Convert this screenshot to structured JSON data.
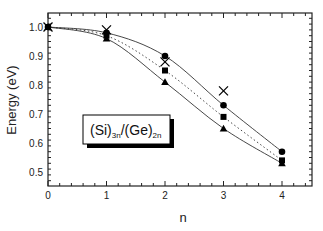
{
  "chart_data": {
    "type": "line",
    "title": "",
    "xlabel": "n",
    "ylabel": "Energy (eV)",
    "xlim": [
      0,
      4.3
    ],
    "ylim": [
      0.45,
      1.05
    ],
    "x_ticks": [
      0,
      1,
      2,
      3,
      4
    ],
    "y_ticks": [
      0.5,
      0.6,
      0.7,
      0.8,
      0.9,
      1.0
    ],
    "x_tick_labels": [
      "0",
      "1",
      "2",
      "3",
      "4"
    ],
    "y_tick_labels": [
      "0.5",
      "0.6",
      "0.7",
      "0.8",
      "0.9",
      "1.0"
    ],
    "grid": false,
    "annotation": {
      "text_main_1": "(Si)",
      "sub_1": "3n",
      "text_main_2": "/(Ge)",
      "sub_2": "2n"
    },
    "series": [
      {
        "name": "circle",
        "marker": "circle",
        "line": "solid",
        "x": [
          0,
          1,
          2,
          3,
          4
        ],
        "values": [
          1.0,
          0.98,
          0.9,
          0.73,
          0.57
        ]
      },
      {
        "name": "square",
        "marker": "square",
        "line": "dotted",
        "x": [
          0,
          1,
          2,
          3,
          4
        ],
        "values": [
          1.0,
          0.97,
          0.85,
          0.69,
          0.54
        ]
      },
      {
        "name": "triangle",
        "marker": "triangle",
        "line": "solid",
        "x": [
          0,
          1,
          2,
          3,
          4
        ],
        "values": [
          1.0,
          0.96,
          0.81,
          0.65,
          0.53
        ]
      },
      {
        "name": "cross",
        "marker": "x",
        "line": "none",
        "x": [
          0,
          1,
          2,
          3
        ],
        "values": [
          1.0,
          0.99,
          0.88,
          0.78
        ]
      }
    ]
  },
  "labels": {
    "xlabel": "n",
    "ylabel": "Energy (eV)"
  }
}
